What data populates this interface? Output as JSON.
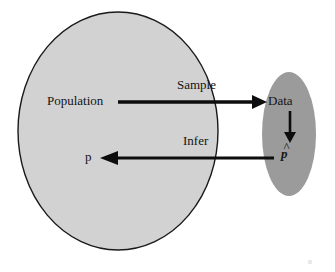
{
  "diagram": {
    "background_color": "#ffffff",
    "shapes": {
      "population_ellipse": {
        "name": "Population",
        "fill": "#d2d2d2",
        "stroke": "#1a1a1a",
        "cx": 118,
        "cy": 131,
        "rx": 100,
        "ry": 119
      },
      "data_ellipse": {
        "name": "Data",
        "fill": "#9b9b9b",
        "stroke": "none",
        "cx": 289,
        "cy": 134,
        "rx": 27,
        "ry": 62
      }
    },
    "labels": {
      "population": "Population",
      "data": "Data",
      "parameter": "p",
      "statistic": "p",
      "statistic_accent": "^"
    },
    "arrows": {
      "sample": {
        "label": "Sample",
        "direction": "right",
        "from": "Population",
        "to": "Data",
        "x1": 118,
        "x2": 265,
        "y": 102,
        "color": "#0d0d0d"
      },
      "infer": {
        "label": "Infer",
        "direction": "left",
        "from": "p-hat",
        "to": "p",
        "x1": 274,
        "x2": 100,
        "y": 158,
        "color": "#0d0d0d"
      },
      "compute": {
        "label": "",
        "direction": "down",
        "from": "Data",
        "to": "p-hat",
        "x": 290,
        "y1": 111,
        "y2": 141,
        "color": "#0d0d0d"
      }
    }
  }
}
